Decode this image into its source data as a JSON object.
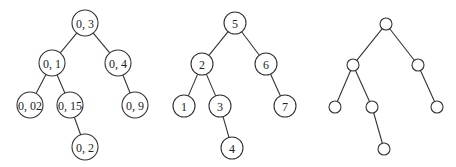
{
  "trees": [
    {
      "name": "tree-decimal",
      "radius": 13,
      "nodes": [
        {
          "id": "a",
          "label": "0, 3",
          "x": 85,
          "y": 23
        },
        {
          "id": "b",
          "label": "0, 1",
          "x": 52,
          "y": 63
        },
        {
          "id": "c",
          "label": "0, 4",
          "x": 118,
          "y": 63
        },
        {
          "id": "d",
          "label": "0, 02",
          "x": 30,
          "y": 105
        },
        {
          "id": "e",
          "label": "0, 15",
          "x": 70,
          "y": 105
        },
        {
          "id": "f",
          "label": "0, 9",
          "x": 135,
          "y": 105
        },
        {
          "id": "g",
          "label": "0, 2",
          "x": 85,
          "y": 147
        }
      ],
      "edges": [
        [
          "a",
          "b"
        ],
        [
          "a",
          "c"
        ],
        [
          "b",
          "d"
        ],
        [
          "b",
          "e"
        ],
        [
          "c",
          "f"
        ],
        [
          "e",
          "g"
        ]
      ]
    },
    {
      "name": "tree-integer",
      "radius": 11,
      "nodes": [
        {
          "id": "a",
          "label": "5",
          "x": 235,
          "y": 23
        },
        {
          "id": "b",
          "label": "2",
          "x": 202,
          "y": 64
        },
        {
          "id": "c",
          "label": "6",
          "x": 266,
          "y": 64
        },
        {
          "id": "d",
          "label": "1",
          "x": 184,
          "y": 106
        },
        {
          "id": "e",
          "label": "3",
          "x": 220,
          "y": 106
        },
        {
          "id": "f",
          "label": "7",
          "x": 285,
          "y": 106
        },
        {
          "id": "g",
          "label": "4",
          "x": 232,
          "y": 148
        }
      ],
      "edges": [
        [
          "a",
          "b"
        ],
        [
          "a",
          "c"
        ],
        [
          "b",
          "d"
        ],
        [
          "b",
          "e"
        ],
        [
          "c",
          "f"
        ],
        [
          "e",
          "g"
        ]
      ]
    },
    {
      "name": "tree-shape",
      "radius": 6,
      "nodes": [
        {
          "id": "a",
          "label": "",
          "x": 386,
          "y": 24
        },
        {
          "id": "b",
          "label": "",
          "x": 353,
          "y": 65
        },
        {
          "id": "c",
          "label": "",
          "x": 418,
          "y": 65
        },
        {
          "id": "d",
          "label": "",
          "x": 335,
          "y": 107
        },
        {
          "id": "e",
          "label": "",
          "x": 372,
          "y": 107
        },
        {
          "id": "f",
          "label": "",
          "x": 437,
          "y": 107
        },
        {
          "id": "g",
          "label": "",
          "x": 384,
          "y": 149
        }
      ],
      "edges": [
        [
          "a",
          "b"
        ],
        [
          "a",
          "c"
        ],
        [
          "b",
          "d"
        ],
        [
          "b",
          "e"
        ],
        [
          "c",
          "f"
        ],
        [
          "e",
          "g"
        ]
      ]
    }
  ]
}
